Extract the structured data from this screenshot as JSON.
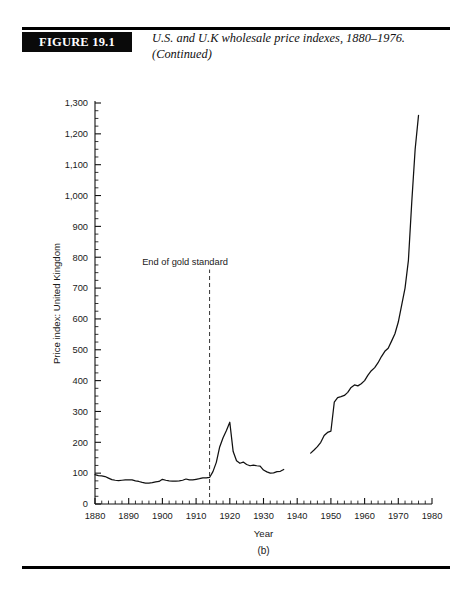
{
  "figure": {
    "label": "FIGURE 19.1",
    "caption_line1": "U.S. and U.K wholesale price indexes, 1880–1976.",
    "caption_line2": "(Continued)",
    "panel_label": "(b)"
  },
  "chart_data": {
    "type": "line",
    "title": "U.S. and U.K wholesale price indexes, 1880–1976.",
    "subtitle": "(Continued)",
    "xlabel": "Year",
    "ylabel": "Price index: United Kingdom",
    "xlim": [
      1880,
      1980
    ],
    "ylim": [
      0,
      1300
    ],
    "grid": false,
    "legend": null,
    "x_ticks": [
      1880,
      1890,
      1900,
      1910,
      1920,
      1930,
      1940,
      1950,
      1960,
      1970,
      1980
    ],
    "x_tick_labels": [
      "1880",
      "1890",
      "1900",
      "1910",
      "1920",
      "1930",
      "1940",
      "1950",
      "1960",
      "1970",
      "1980"
    ],
    "x_minor_step": 2,
    "y_ticks": [
      0,
      100,
      200,
      300,
      400,
      500,
      600,
      700,
      800,
      900,
      1000,
      1100,
      1200,
      1300
    ],
    "y_tick_labels": [
      "0",
      "100",
      "200",
      "300",
      "400",
      "500",
      "600",
      "700",
      "800",
      "900",
      "1,000",
      "1,100",
      "1,200",
      "1,300"
    ],
    "y_minor_step": 25,
    "annotations": [
      {
        "text": "End of gold standard",
        "x": 1914,
        "line_type": "dashed",
        "line_from_y": 0,
        "line_to_y": 760,
        "label_x": 1894,
        "label_y": 775
      }
    ],
    "series": [
      {
        "name": "Price index: United Kingdom",
        "color": "#111111",
        "segments": [
          {
            "name": "1880-1936",
            "x": [
              1880,
              1881,
              1882,
              1883,
              1884,
              1885,
              1886,
              1887,
              1888,
              1889,
              1890,
              1891,
              1892,
              1893,
              1894,
              1895,
              1896,
              1897,
              1898,
              1899,
              1900,
              1901,
              1902,
              1903,
              1904,
              1905,
              1906,
              1907,
              1908,
              1909,
              1910,
              1911,
              1912,
              1913,
              1914,
              1915,
              1916,
              1917,
              1918,
              1919,
              1920,
              1921,
              1922,
              1923,
              1924,
              1925,
              1926,
              1927,
              1928,
              1929,
              1930,
              1931,
              1932,
              1933,
              1934,
              1935,
              1936
            ],
            "y": [
              95,
              92,
              91,
              89,
              84,
              79,
              77,
              76,
              77,
              78,
              78,
              78,
              75,
              73,
              70,
              68,
              68,
              69,
              72,
              73,
              80,
              77,
              75,
              74,
              74,
              75,
              77,
              81,
              78,
              78,
              80,
              82,
              85,
              85,
              86,
              105,
              135,
              185,
              215,
              238,
              265,
              170,
              140,
              132,
              136,
              128,
              124,
              126,
              124,
              123,
              110,
              104,
              100,
              101,
              105,
              106,
              112
            ]
          },
          {
            "name": "1944-1976",
            "x": [
              1944,
              1945,
              1946,
              1947,
              1948,
              1949,
              1950,
              1951,
              1952,
              1953,
              1954,
              1955,
              1956,
              1957,
              1958,
              1959,
              1960,
              1961,
              1962,
              1963,
              1964,
              1965,
              1966,
              1967,
              1968,
              1969,
              1970,
              1971,
              1972,
              1973,
              1974,
              1975,
              1976
            ],
            "y": [
              165,
              175,
              186,
              200,
              222,
              232,
              236,
              330,
              345,
              348,
              352,
              362,
              378,
              386,
              383,
              390,
              400,
              418,
              432,
              442,
              458,
              478,
              495,
              505,
              528,
              552,
              590,
              645,
              700,
              790,
              980,
              1150,
              1260
            ]
          }
        ]
      }
    ]
  }
}
